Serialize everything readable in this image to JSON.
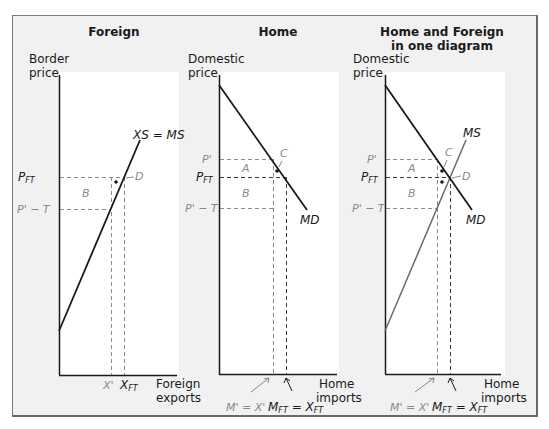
{
  "panels": [
    {
      "title": "Foreign",
      "y_axis_label": [
        "Border",
        "price"
      ],
      "x_axis_label": [
        "Foreign",
        "exports"
      ],
      "curve_labels": {
        "supply": "XS = MS"
      },
      "price_labels": {
        "p_ft": "P",
        "p_ft_sub": "FT",
        "p_prime_minus_t": "P' − T"
      },
      "quantity_labels": {
        "x_prime": "X'",
        "x_ft": "X",
        "x_ft_sub": "FT"
      },
      "area_labels": {
        "b": "B"
      },
      "point_labels": {
        "d": "D"
      }
    },
    {
      "title": "Home",
      "y_axis_label": [
        "Domestic",
        "price"
      ],
      "x_axis_label": [
        "Home",
        "imports"
      ],
      "curve_labels": {
        "demand": "MD"
      },
      "price_labels": {
        "p_prime": "P'",
        "p_ft": "P",
        "p_ft_sub": "FT",
        "p_prime_minus_t": "P' − T"
      },
      "quantity_labels": {
        "m_prime": "M' = X'",
        "m_ft": "M",
        "m_ft_sub": "FT",
        "eq": " = X",
        "x_ft_sub": "FT"
      },
      "area_labels": {
        "a": "A",
        "b": "B"
      },
      "point_labels": {
        "c": "C"
      }
    },
    {
      "title": [
        "Home and Foreign",
        "in one diagram"
      ],
      "y_axis_label": [
        "Domestic",
        "price"
      ],
      "x_axis_label": [
        "Home",
        "imports"
      ],
      "curve_labels": {
        "supply": "MS",
        "demand": "MD"
      },
      "price_labels": {
        "p_prime": "P'",
        "p_ft": "P",
        "p_ft_sub": "FT",
        "p_prime_minus_t": "P' − T"
      },
      "quantity_labels": {
        "m_prime": "M' = X'",
        "m_ft": "M",
        "m_ft_sub": "FT",
        "eq": " = X",
        "x_ft_sub": "FT"
      },
      "area_labels": {
        "a": "A",
        "b": "B"
      },
      "point_labels": {
        "c": "C",
        "d": "D"
      }
    }
  ],
  "colors": {
    "frame_bg": "#f1f1f1",
    "plot_bg": "#ffffff",
    "axis": "#1a1a1a",
    "dash": "#8a8a8a",
    "gray_label": "#8a8a8a"
  }
}
